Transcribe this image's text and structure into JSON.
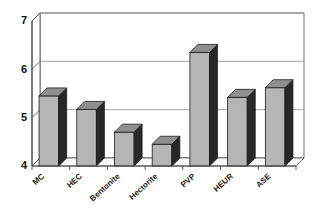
{
  "chart_data": {
    "type": "bar",
    "title": "",
    "subtitle": "",
    "xlabel": "",
    "ylabel": "",
    "categories": [
      "MC",
      "HEC",
      "Bentonite",
      "Hectorite",
      "PVP",
      "HEUR",
      "ASE"
    ],
    "values": [
      5.45,
      5.17,
      4.7,
      4.45,
      6.35,
      5.42,
      5.62
    ],
    "ylim": [
      4,
      7
    ],
    "yticks": [
      4,
      5,
      6,
      7
    ],
    "ytick_labels": [
      "4",
      "5",
      "6",
      "7"
    ],
    "grid": true,
    "grid_axis": "y",
    "legend": false,
    "legend_position": "none",
    "style": "3d-column",
    "series": [
      {
        "name": "",
        "values": [
          5.45,
          5.17,
          4.7,
          4.45,
          6.35,
          5.42,
          5.62
        ]
      }
    ],
    "colors": {
      "bar_face": "#b5b5b5",
      "bar_side": "#282828",
      "bar_top": "#8f8f8f",
      "bar_outline": "#1a1a1a",
      "grid": "#9a9a9a",
      "axis": "#4a4a4a",
      "background": "#ffffff",
      "text": "#111111"
    }
  }
}
